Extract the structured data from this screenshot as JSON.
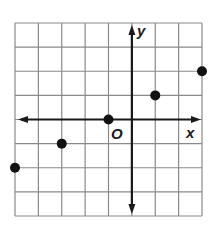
{
  "chart_data": {
    "type": "scatter",
    "title": "",
    "xlabel": "x",
    "ylabel": "y",
    "origin_label": "O",
    "xlim": [
      -5,
      3
    ],
    "ylim": [
      -4,
      4
    ],
    "grid": true,
    "grid_step": 1,
    "points": [
      {
        "x": -5,
        "y": -2
      },
      {
        "x": -3,
        "y": -1
      },
      {
        "x": -1,
        "y": 0
      },
      {
        "x": 1,
        "y": 1
      },
      {
        "x": 3,
        "y": 2
      }
    ],
    "colors": {
      "grid": "#8a8a8a",
      "axis": "#1a1a1a",
      "point": "#111111",
      "background": "#ffffff"
    }
  }
}
